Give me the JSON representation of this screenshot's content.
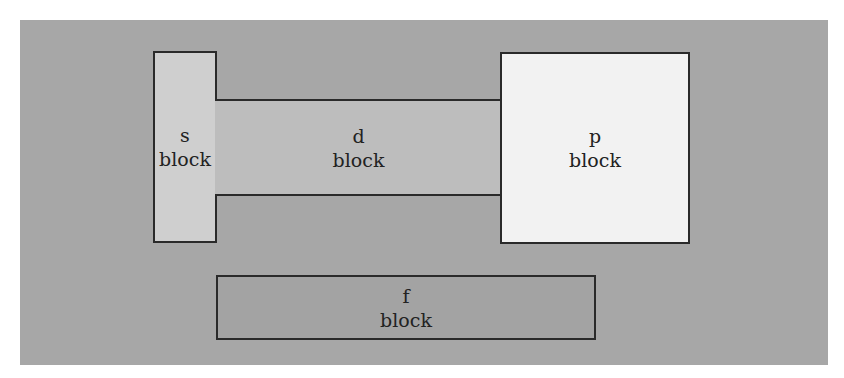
{
  "diagram": {
    "title": "",
    "background_color": "#a7a7a7",
    "blocks": [
      {
        "id": "s",
        "line1": "s",
        "line2": "block",
        "fill": "#cfcfcf"
      },
      {
        "id": "d",
        "line1": "d",
        "line2": "block",
        "fill": "#bdbdbd"
      },
      {
        "id": "p",
        "line1": "p",
        "line2": "block",
        "fill": "#f2f2f2"
      },
      {
        "id": "f",
        "line1": "f",
        "line2": "block",
        "fill": "#a3a3a3"
      }
    ]
  }
}
